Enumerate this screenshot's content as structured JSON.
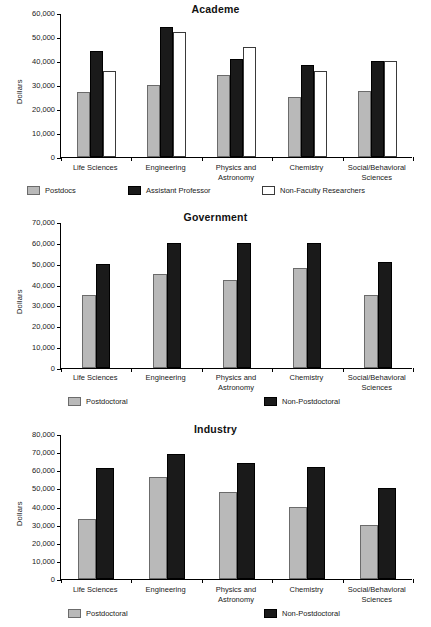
{
  "figure": {
    "ylabel": "Dollars",
    "panels": [
      "academe",
      "government",
      "industry"
    ]
  },
  "chart_data": [
    {
      "type": "bar",
      "title": "Academe",
      "xlabel": "",
      "ylabel": "Dollars",
      "ylim": [
        0,
        60000
      ],
      "yticks": [
        0,
        10000,
        20000,
        30000,
        40000,
        50000,
        60000
      ],
      "ytick_labels": [
        "0",
        "10,000",
        "20,000",
        "30,000",
        "40,000",
        "50,000",
        "60,000"
      ],
      "grid": false,
      "legend_position": "bottom",
      "categories": [
        "Life Sciences",
        "Engineering",
        "Physics and\nAstronomy",
        "Chemistry",
        "Social/Behavioral\nSciences"
      ],
      "series": [
        {
          "name": "Postdocs",
          "color": "#b9b9b9",
          "values": [
            27000,
            30000,
            34000,
            25000,
            27500
          ]
        },
        {
          "name": "Assistant Professor",
          "color": "#1a1a1a",
          "values": [
            44000,
            54000,
            41000,
            38500,
            40000
          ]
        },
        {
          "name": "Non-Faculty Researchers",
          "color": "#ffffff",
          "values": [
            36000,
            52000,
            46000,
            36000,
            40000
          ]
        }
      ]
    },
    {
      "type": "bar",
      "title": "Government",
      "xlabel": "",
      "ylabel": "Dollars",
      "ylim": [
        0,
        70000
      ],
      "yticks": [
        0,
        10000,
        20000,
        30000,
        40000,
        50000,
        60000,
        70000
      ],
      "ytick_labels": [
        "0",
        "10,000",
        "20,000",
        "30,000",
        "40,000",
        "50,000",
        "60,000",
        "70,000"
      ],
      "grid": false,
      "legend_position": "bottom",
      "categories": [
        "Life Sciences",
        "Engineering",
        "Physics and\nAstronomy",
        "Chemistry",
        "Social/Behavioral\nSciences"
      ],
      "series": [
        {
          "name": "Postdoctoral",
          "color": "#b9b9b9",
          "values": [
            35000,
            45000,
            42000,
            48000,
            35000
          ]
        },
        {
          "name": "Non-Postdoctoral",
          "color": "#1a1a1a",
          "values": [
            50000,
            60000,
            60000,
            60000,
            51000
          ]
        }
      ]
    },
    {
      "type": "bar",
      "title": "Industry",
      "xlabel": "",
      "ylabel": "Dollars",
      "ylim": [
        0,
        80000
      ],
      "yticks": [
        0,
        10000,
        20000,
        30000,
        40000,
        50000,
        60000,
        70000,
        80000
      ],
      "ytick_labels": [
        "0",
        "10,000",
        "20,000",
        "30,000",
        "40,000",
        "50,000",
        "60,000",
        "70,000",
        "80,000"
      ],
      "grid": false,
      "legend_position": "bottom",
      "categories": [
        "Life Sciences",
        "Engineering",
        "Physics and\nAstronomy",
        "Chemistry",
        "Social/Behavioral\nSciences"
      ],
      "series": [
        {
          "name": "Postdoctoral",
          "color": "#b9b9b9",
          "values": [
            33000,
            56500,
            48000,
            40000,
            30000
          ]
        },
        {
          "name": "Non-Postdoctoral",
          "color": "#1a1a1a",
          "values": [
            61000,
            69000,
            64000,
            62000,
            50000
          ]
        }
      ]
    }
  ]
}
